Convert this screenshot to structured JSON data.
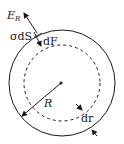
{
  "diagram": {
    "labels": {
      "field": "E",
      "field_sub": "R",
      "surface_charge": "σdS",
      "force": "dF",
      "radius": "R",
      "thickness": "dr"
    },
    "colors": {
      "stroke": "#1a1a1a",
      "background": "#ffffff"
    },
    "shapes": {
      "outer_circle": {
        "cx": 62,
        "cy": 83,
        "r": 53,
        "style": "solid"
      },
      "inner_circle": {
        "cx": 62,
        "cy": 83,
        "r": 38,
        "style": "dashed"
      },
      "center_dot": {
        "cx": 61,
        "cy": 83
      }
    }
  }
}
